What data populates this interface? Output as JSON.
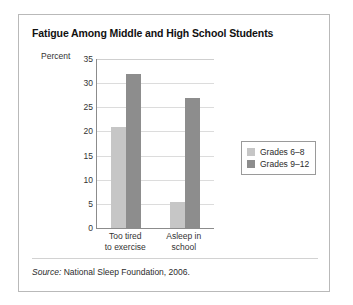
{
  "figure": {
    "title": "Fatigue Among Middle and High School Students",
    "source_word": "Source:",
    "source_text": " National Sleep Foundation, 2006."
  },
  "chart_data": {
    "type": "bar",
    "title": "Fatigue Among Middle and High School Students",
    "xlabel": "",
    "ylabel": "Percent",
    "ylim": [
      0,
      35
    ],
    "yticks": [
      0,
      5,
      10,
      15,
      20,
      25,
      30,
      35
    ],
    "ytick_labels": [
      "0",
      "5",
      "10",
      "15",
      "20",
      "25",
      "30",
      "35"
    ],
    "grid": true,
    "legend_position": "right",
    "categories": [
      "Too tired to exercise",
      "Asleep in school"
    ],
    "category_lines": [
      [
        "Too tired",
        "to exercise"
      ],
      [
        "Asleep in",
        "school"
      ]
    ],
    "series": [
      {
        "name": "Grades 6–8",
        "color": "#c6c6c6",
        "values": [
          21,
          5.3
        ]
      },
      {
        "name": "Grades 9–12",
        "color": "#8d8d8d",
        "values": [
          32,
          27
        ]
      }
    ]
  }
}
